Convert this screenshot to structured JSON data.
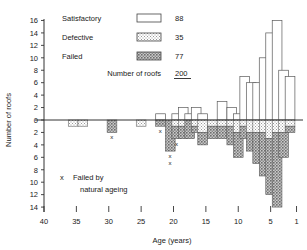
{
  "chart_data": {
    "type": "bar",
    "title": "",
    "xlabel": "Age (years)",
    "ylabel": "Number of roofs",
    "xlim": [
      40,
      0
    ],
    "ylim_up": [
      0,
      16
    ],
    "ylim_down": [
      0,
      14
    ],
    "x_ticks": [
      "40",
      "35",
      "30",
      "25",
      "20",
      "15",
      "10",
      "5",
      "1"
    ],
    "x_tick_values": [
      40,
      35,
      30,
      25,
      20,
      15,
      10,
      5,
      1
    ],
    "y_ticks_up": [
      "0",
      "2",
      "4",
      "6",
      "8",
      "10",
      "12",
      "14",
      "16"
    ],
    "y_ticks_down": [
      "2",
      "4",
      "6",
      "8",
      "10",
      "12",
      "14"
    ],
    "grid": false,
    "legend_position": "top-left",
    "note": "x  Failed by natural ageing",
    "bin_width_years": 1.5,
    "series": [
      {
        "name": "Satisfactory",
        "direction": "up",
        "fill": "white"
      },
      {
        "name": "Defective",
        "direction": "down",
        "fill": "light-dot"
      },
      {
        "name": "Failed",
        "direction": "down",
        "fill": "dark-hatch"
      }
    ],
    "bins": [
      {
        "age": 38.5,
        "satisfactory": 0,
        "defective": 0,
        "failed": 0,
        "x_marks": 0
      },
      {
        "age": 37.0,
        "satisfactory": 0,
        "defective": 0,
        "failed": 0,
        "x_marks": 0
      },
      {
        "age": 35.5,
        "satisfactory": 0,
        "defective": 1,
        "failed": 0,
        "x_marks": 0
      },
      {
        "age": 34.0,
        "satisfactory": 0,
        "defective": 1,
        "failed": 0,
        "x_marks": 0
      },
      {
        "age": 32.5,
        "satisfactory": 0,
        "defective": 0,
        "failed": 0,
        "x_marks": 0
      },
      {
        "age": 31.0,
        "satisfactory": 0,
        "defective": 0,
        "failed": 0,
        "x_marks": 0
      },
      {
        "age": 29.5,
        "satisfactory": 0,
        "defective": 0,
        "failed": 2,
        "x_marks": 1
      },
      {
        "age": 28.0,
        "satisfactory": 0,
        "defective": 0,
        "failed": 0,
        "x_marks": 0
      },
      {
        "age": 26.5,
        "satisfactory": 0,
        "defective": 0,
        "failed": 0,
        "x_marks": 0
      },
      {
        "age": 25.0,
        "satisfactory": 0,
        "defective": 1,
        "failed": 0,
        "x_marks": 0
      },
      {
        "age": 23.5,
        "satisfactory": 0,
        "defective": 0,
        "failed": 0,
        "x_marks": 0
      },
      {
        "age": 22.0,
        "satisfactory": 1,
        "defective": 0,
        "failed": 1,
        "x_marks": 1
      },
      {
        "age": 20.5,
        "satisfactory": 0,
        "defective": 0,
        "failed": 5,
        "x_marks": 2
      },
      {
        "age": 19.5,
        "satisfactory": 1,
        "defective": 1,
        "failed": 2,
        "x_marks": 1
      },
      {
        "age": 18.5,
        "satisfactory": 2,
        "defective": 1,
        "failed": 2,
        "x_marks": 0
      },
      {
        "age": 17.5,
        "satisfactory": 1,
        "defective": 0,
        "failed": 3,
        "x_marks": 0
      },
      {
        "age": 16.5,
        "satisfactory": 2,
        "defective": 1,
        "failed": 1,
        "x_marks": 0
      },
      {
        "age": 15.5,
        "satisfactory": 1,
        "defective": 2,
        "failed": 2,
        "x_marks": 0
      },
      {
        "age": 14.0,
        "satisfactory": 0,
        "defective": 1,
        "failed": 2,
        "x_marks": 0
      },
      {
        "age": 12.5,
        "satisfactory": 3,
        "defective": 1,
        "failed": 2,
        "x_marks": 0
      },
      {
        "age": 11.0,
        "satisfactory": 2,
        "defective": 1,
        "failed": 3,
        "x_marks": 0
      },
      {
        "age": 10.0,
        "satisfactory": 1,
        "defective": 2,
        "failed": 4,
        "x_marks": 0
      },
      {
        "age": 9.0,
        "satisfactory": 7,
        "defective": 1,
        "failed": 2,
        "x_marks": 0
      },
      {
        "age": 8.0,
        "satisfactory": 6,
        "defective": 2,
        "failed": 3,
        "x_marks": 0
      },
      {
        "age": 7.0,
        "satisfactory": 6,
        "defective": 2,
        "failed": 5,
        "x_marks": 0
      },
      {
        "age": 6.0,
        "satisfactory": 10,
        "defective": 2,
        "failed": 7,
        "x_marks": 0
      },
      {
        "age": 5.0,
        "satisfactory": 14,
        "defective": 3,
        "failed": 9,
        "x_marks": 0
      },
      {
        "age": 4.0,
        "satisfactory": 16,
        "defective": 2,
        "failed": 12,
        "x_marks": 0
      },
      {
        "age": 3.0,
        "satisfactory": 8,
        "defective": 2,
        "failed": 4,
        "x_marks": 0
      },
      {
        "age": 2.0,
        "satisfactory": 7,
        "defective": 1,
        "failed": 1,
        "x_marks": 0
      }
    ]
  },
  "legend": {
    "rows": [
      {
        "label": "Satisfactory",
        "value": "88",
        "swatch": "white"
      },
      {
        "label": "Defective",
        "value": "35",
        "swatch": "light-dot"
      },
      {
        "label": "Failed",
        "value": "77",
        "swatch": "dark-hatch"
      }
    ],
    "total_label": "Number of roofs",
    "total_value": "200"
  },
  "annotation": {
    "marker": "x",
    "line1": "Failed by",
    "line2": "natural ageing"
  },
  "axes": {
    "ylabel": "Number of roofs",
    "xlabel": "Age (years)"
  }
}
